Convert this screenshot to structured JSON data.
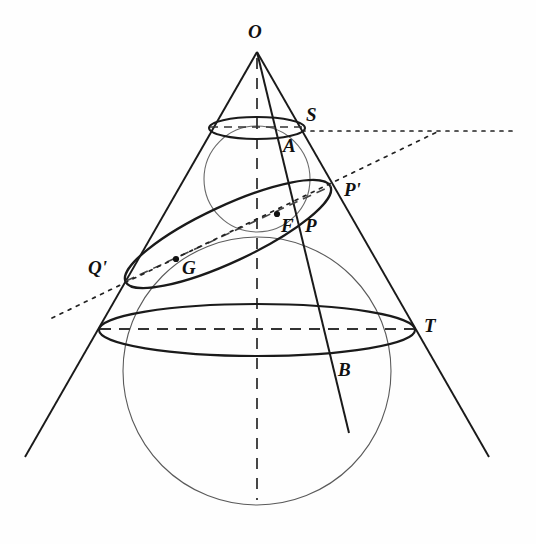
{
  "figure": {
    "stroke_color": "#1a1a1a",
    "light_stroke_color": "#555555",
    "background": "#fefefe"
  },
  "labels": [
    {
      "id": "O",
      "text": "O",
      "x": 248,
      "y": 22,
      "name": "label-apex-o"
    },
    {
      "id": "S",
      "text": "S",
      "x": 306,
      "y": 105,
      "name": "label-point-s"
    },
    {
      "id": "A",
      "text": "A",
      "x": 283,
      "y": 136,
      "name": "label-point-a"
    },
    {
      "id": "Pp",
      "text": "P'",
      "x": 344,
      "y": 180,
      "name": "label-point-p-prime"
    },
    {
      "id": "F",
      "text": "F",
      "x": 281,
      "y": 216,
      "name": "label-focus-f"
    },
    {
      "id": "P",
      "text": "P",
      "x": 305,
      "y": 216,
      "name": "label-point-p"
    },
    {
      "id": "Qp",
      "text": "Q'",
      "x": 88,
      "y": 258,
      "name": "label-point-q-prime"
    },
    {
      "id": "G",
      "text": "G",
      "x": 182,
      "y": 258,
      "name": "label-point-g"
    },
    {
      "id": "T",
      "text": "T",
      "x": 424,
      "y": 316,
      "name": "label-point-t"
    },
    {
      "id": "B",
      "text": "B",
      "x": 338,
      "y": 360,
      "name": "label-point-b"
    }
  ],
  "points": [
    {
      "id": "F",
      "x": 277,
      "y": 214,
      "name": "dot-focus-f"
    },
    {
      "id": "G",
      "x": 176,
      "y": 259,
      "name": "dot-point-g"
    }
  ],
  "geometry": {
    "apex": {
      "x": 257,
      "y": 52
    },
    "axis": {
      "x": 257,
      "y_top": 52,
      "y_bottom": 500
    },
    "cone_left_edge": {
      "x1": 257,
      "y1": 52,
      "x2": 25,
      "y2": 457
    },
    "cone_right_edge": {
      "x1": 257,
      "y1": 52,
      "x2": 489,
      "y2": 457
    },
    "secant_line_OB": {
      "x1": 257,
      "y1": 52,
      "x2": 349,
      "y2": 433
    },
    "small_sphere": {
      "cx": 257,
      "cy": 179,
      "r": 53
    },
    "large_sphere": {
      "cx": 257,
      "cy": 371,
      "r": 134
    },
    "upper_circle": {
      "cx": 257,
      "cy": 128,
      "rx": 48,
      "ry": 11
    },
    "lower_circle": {
      "cx": 257,
      "cy": 330,
      "rx": 158,
      "ry": 26
    },
    "section_ellipse": {
      "cx": 228,
      "cy": 234,
      "rx": 113,
      "ry": 28,
      "rotation": -25
    },
    "directrix_vertex": {
      "x": 437,
      "y": 132
    },
    "directrix_horizontal": {
      "x1": 302,
      "y1": 131,
      "x2": 516,
      "y2": 131
    },
    "directrix_slanted": {
      "x1": 52,
      "y1": 318,
      "x2": 437,
      "y2": 132
    }
  }
}
